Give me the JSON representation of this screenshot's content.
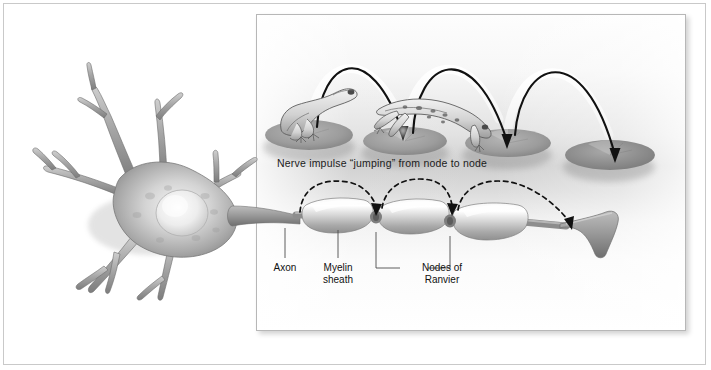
{
  "figure": {
    "caption": "Nerve impulse “jumping” from node to node"
  },
  "labels": {
    "axon": "Axon",
    "myelin_sheath": "Myelin\nsheath",
    "nodes_of_ranvier": "Nodes of\nRanvier"
  },
  "colors": {
    "ink": "#1b1b1b",
    "frame": "#c9c9c9",
    "panel_border": "#b7b7b7",
    "cell_body": "#a8a8a8",
    "cell_body_light": "#e8e8e8",
    "myelin": "#dcdcdc",
    "axon": "#8f8f8f",
    "lilypad": "#9a9a9a",
    "frog": "#d8d8d8",
    "arc": "#111111",
    "background": "#ffffff"
  },
  "analogy_scene": {
    "description": "A frog hopping between lily pads illustrates the impulse jumping between nodes",
    "lilypads": 4,
    "frogs": [
      {
        "state": "sitting",
        "pad_index": 1
      },
      {
        "state": "leaping",
        "pad_index": 3
      }
    ],
    "jump_arcs": 3
  },
  "neuron": {
    "dendrite_count": 7,
    "has_nucleus": true,
    "myelin_segments": 3,
    "nodes_of_ranvier": 2,
    "impulse_arcs": 3,
    "has_axon_terminal": true
  }
}
